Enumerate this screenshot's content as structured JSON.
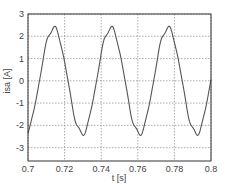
{
  "chart_data": {
    "type": "line",
    "title": "",
    "xlabel": "t [s]",
    "ylabel": "isa [A]",
    "xlim": [
      0.7,
      0.8
    ],
    "ylim": [
      -3.6,
      3
    ],
    "grid": true,
    "legend": null,
    "xticks": [
      0.7,
      0.72,
      0.74,
      0.76,
      0.78,
      0.8
    ],
    "xtick_labels": [
      "0.7",
      "0.72",
      "0.74",
      "0.76",
      "0.78",
      "0.8"
    ],
    "yticks": [
      3,
      2,
      1,
      0,
      -1,
      -2,
      -3
    ],
    "ytick_labels": [
      "3",
      "2",
      "1",
      "0",
      "-1",
      "-2",
      "-3"
    ],
    "series": [
      {
        "name": "isa",
        "color": "#555555",
        "model": {
          "amplitude": 2.38,
          "period": 0.0312,
          "peak_time": 0.714,
          "ripple": 0.08
        },
        "x": [
          0.7,
          0.704,
          0.708,
          0.712,
          0.714,
          0.716,
          0.72,
          0.724,
          0.728,
          0.73,
          0.732,
          0.736,
          0.74,
          0.744,
          0.7452,
          0.748,
          0.752,
          0.756,
          0.76,
          0.7608,
          0.764,
          0.768,
          0.772,
          0.776,
          0.7764,
          0.78,
          0.784,
          0.788,
          0.792,
          0.792,
          0.796,
          0.8
        ],
        "y": [
          -2.35,
          -1.3,
          0.55,
          2.15,
          2.4,
          2.2,
          0.95,
          -0.95,
          -2.2,
          -2.38,
          -2.25,
          -1.2,
          0.7,
          2.25,
          2.4,
          1.95,
          0.2,
          -1.65,
          -2.35,
          -2.38,
          -1.95,
          -0.35,
          1.55,
          2.38,
          2.4,
          1.7,
          -0.1,
          -1.8,
          -2.36,
          -2.36,
          -1.5,
          0.8
        ]
      }
    ]
  }
}
